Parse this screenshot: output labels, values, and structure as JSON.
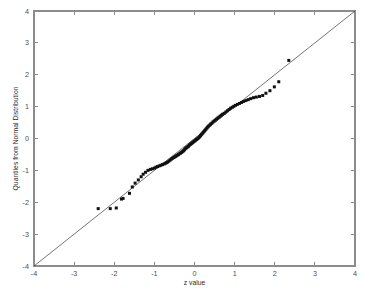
{
  "chart_data": {
    "type": "scatter",
    "title": "",
    "xlabel": "z value",
    "ylabel": "Quantiles from Normal Distribution",
    "xlim": [
      -4,
      4
    ],
    "ylim": [
      -4,
      4
    ],
    "grid": false,
    "legend": null,
    "xticks": [
      -4,
      -3,
      -2,
      -1,
      0,
      1,
      2,
      3,
      4
    ],
    "yticks": [
      -4,
      -3,
      -2,
      -1,
      0,
      1,
      2,
      3,
      4
    ],
    "xticklabels": [
      "-4",
      "-3",
      "-2",
      "-1",
      "0",
      "1",
      "2",
      "3",
      "4"
    ],
    "yticklabels": [
      "-4",
      "-3",
      "-2",
      "-1",
      "0",
      "1",
      "2",
      "3",
      "4"
    ],
    "reference_line": {
      "name": "y = x reference line",
      "x": [
        -4,
        4
      ],
      "y": [
        -4,
        4
      ],
      "color": "#3a3a3a"
    },
    "series": [
      {
        "name": "Sample quantiles",
        "marker": "square",
        "marker_size": 3,
        "color": "#111111",
        "points": [
          [
            -2.4,
            -2.2
          ],
          [
            -2.1,
            -2.2
          ],
          [
            -1.95,
            -2.18
          ],
          [
            -1.82,
            -1.9
          ],
          [
            -1.78,
            -1.88
          ],
          [
            -1.62,
            -1.72
          ],
          [
            -1.55,
            -1.52
          ],
          [
            -1.48,
            -1.4
          ],
          [
            -1.4,
            -1.3
          ],
          [
            -1.33,
            -1.2
          ],
          [
            -1.28,
            -1.12
          ],
          [
            -1.22,
            -1.06
          ],
          [
            -1.16,
            -1.0
          ],
          [
            -1.1,
            -0.97
          ],
          [
            -1.05,
            -0.95
          ],
          [
            -1.0,
            -0.93
          ],
          [
            -0.96,
            -0.9
          ],
          [
            -0.92,
            -0.88
          ],
          [
            -0.88,
            -0.86
          ],
          [
            -0.84,
            -0.84
          ],
          [
            -0.8,
            -0.82
          ],
          [
            -0.76,
            -0.8
          ],
          [
            -0.73,
            -0.78
          ],
          [
            -0.7,
            -0.76
          ],
          [
            -0.67,
            -0.74
          ],
          [
            -0.64,
            -0.71
          ],
          [
            -0.61,
            -0.68
          ],
          [
            -0.58,
            -0.65
          ],
          [
            -0.55,
            -0.62
          ],
          [
            -0.52,
            -0.6
          ],
          [
            -0.5,
            -0.58
          ],
          [
            -0.47,
            -0.56
          ],
          [
            -0.45,
            -0.54
          ],
          [
            -0.42,
            -0.52
          ],
          [
            -0.4,
            -0.5
          ],
          [
            -0.38,
            -0.48
          ],
          [
            -0.35,
            -0.46
          ],
          [
            -0.33,
            -0.44
          ],
          [
            -0.31,
            -0.42
          ],
          [
            -0.29,
            -0.4
          ],
          [
            -0.27,
            -0.38
          ],
          [
            -0.25,
            -0.35
          ],
          [
            -0.23,
            -0.32
          ],
          [
            -0.21,
            -0.3
          ],
          [
            -0.19,
            -0.28
          ],
          [
            -0.17,
            -0.26
          ],
          [
            -0.15,
            -0.24
          ],
          [
            -0.13,
            -0.21
          ],
          [
            -0.11,
            -0.19
          ],
          [
            -0.09,
            -0.17
          ],
          [
            -0.07,
            -0.15
          ],
          [
            -0.05,
            -0.13
          ],
          [
            -0.03,
            -0.11
          ],
          [
            -0.01,
            -0.09
          ],
          [
            0.01,
            -0.07
          ],
          [
            0.03,
            -0.05
          ],
          [
            0.05,
            -0.03
          ],
          [
            0.07,
            -0.01
          ],
          [
            0.09,
            0.01
          ],
          [
            0.11,
            0.03
          ],
          [
            0.13,
            0.06
          ],
          [
            0.15,
            0.09
          ],
          [
            0.17,
            0.12
          ],
          [
            0.19,
            0.15
          ],
          [
            0.21,
            0.18
          ],
          [
            0.23,
            0.21
          ],
          [
            0.25,
            0.24
          ],
          [
            0.27,
            0.27
          ],
          [
            0.29,
            0.3
          ],
          [
            0.31,
            0.33
          ],
          [
            0.33,
            0.36
          ],
          [
            0.35,
            0.39
          ],
          [
            0.38,
            0.42
          ],
          [
            0.4,
            0.45
          ],
          [
            0.43,
            0.48
          ],
          [
            0.46,
            0.52
          ],
          [
            0.49,
            0.55
          ],
          [
            0.52,
            0.58
          ],
          [
            0.55,
            0.61
          ],
          [
            0.58,
            0.64
          ],
          [
            0.61,
            0.67
          ],
          [
            0.64,
            0.7
          ],
          [
            0.67,
            0.73
          ],
          [
            0.7,
            0.76
          ],
          [
            0.74,
            0.79
          ],
          [
            0.78,
            0.83
          ],
          [
            0.82,
            0.87
          ],
          [
            0.86,
            0.91
          ],
          [
            0.9,
            0.95
          ],
          [
            0.94,
            0.98
          ],
          [
            0.98,
            1.01
          ],
          [
            1.02,
            1.04
          ],
          [
            1.07,
            1.07
          ],
          [
            1.12,
            1.1
          ],
          [
            1.17,
            1.13
          ],
          [
            1.22,
            1.16
          ],
          [
            1.28,
            1.19
          ],
          [
            1.34,
            1.22
          ],
          [
            1.4,
            1.25
          ],
          [
            1.47,
            1.28
          ],
          [
            1.54,
            1.3
          ],
          [
            1.62,
            1.32
          ],
          [
            1.7,
            1.35
          ],
          [
            1.78,
            1.42
          ],
          [
            1.88,
            1.5
          ],
          [
            1.99,
            1.62
          ],
          [
            2.1,
            1.78
          ],
          [
            2.35,
            2.45
          ]
        ]
      }
    ]
  }
}
